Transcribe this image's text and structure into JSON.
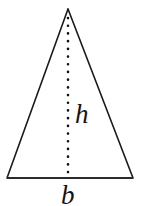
{
  "figure": {
    "kind": "geometry-diagram",
    "shape_name": "triangle",
    "background_color": "#ffffff",
    "stroke_color": "#1a1a1a",
    "stroke_width": 1.6,
    "canvas": {
      "width": 144,
      "height": 206
    },
    "vertices": {
      "apex": {
        "x": 68,
        "y": 9
      },
      "bottom_left": {
        "x": 7,
        "y": 178
      },
      "bottom_right": {
        "x": 133,
        "y": 178
      }
    },
    "base_line": {
      "name": "base",
      "from": {
        "x": 7,
        "y": 178
      },
      "to": {
        "x": 133,
        "y": 178
      },
      "stroke_width": 2.1,
      "color": "#2b2b2b"
    },
    "altitude": {
      "name": "height-altitude",
      "style": "dotted",
      "from": {
        "x": 68,
        "y": 18
      },
      "to": {
        "x": 68,
        "y": 178
      },
      "dot_size": 2.6,
      "dot_gap": 7.6,
      "color": "#111111"
    },
    "labels": {
      "height": {
        "text": "h",
        "meaning": "height",
        "font_style": "italic",
        "font_size_px": 27,
        "color": "#141414",
        "x": 75,
        "y": 101
      },
      "base": {
        "text": "b",
        "meaning": "base",
        "font_style": "italic",
        "font_size_px": 27,
        "color": "#141414",
        "x": 61,
        "y": 182,
        "clipped_at_bottom": true
      }
    }
  }
}
